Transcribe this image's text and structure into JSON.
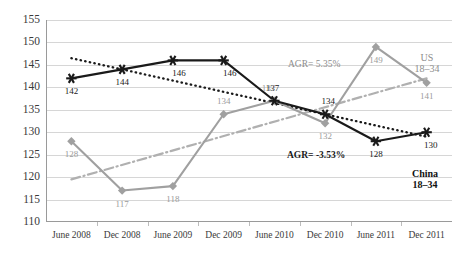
{
  "chart_data": {
    "type": "line",
    "title": "",
    "xlabel": "",
    "ylabel": "",
    "ylim": [
      110,
      155
    ],
    "ytick_step": 5,
    "yticks": [
      155,
      150,
      145,
      140,
      135,
      130,
      125,
      120,
      115,
      110
    ],
    "grid": true,
    "legend_position": "inline-right",
    "categories": [
      "June 2008",
      "Dec 2008",
      "June 2009",
      "Dec 2009",
      "June 2010",
      "Dec 2010",
      "June 2011",
      "Dec 2011"
    ],
    "series": [
      {
        "name": "China 18-34",
        "marker": "star",
        "color": "#1a1a1a",
        "values": [
          142,
          144,
          146,
          146,
          137,
          134,
          128,
          130
        ],
        "labels": [
          "142",
          "144",
          "146",
          "146",
          "137",
          "134",
          "128",
          "130"
        ]
      },
      {
        "name": "US 18-34",
        "marker": "diamond",
        "color": "#a0a0a0",
        "values": [
          128,
          117,
          118,
          134,
          137,
          132,
          149,
          141
        ],
        "labels": [
          "128",
          "117",
          "118",
          "134",
          "137",
          "132",
          "149",
          "141"
        ]
      }
    ],
    "trendlines": [
      {
        "name": "China trend",
        "style": "dotted",
        "color": "#1a1a1a",
        "start_value": 146.5,
        "end_value": 129.0,
        "annotation": "AGR= -3.53%"
      },
      {
        "name": "US trend",
        "style": "dash-dot",
        "color": "#b0b0b0",
        "start_value": 119.5,
        "end_value": 142.0,
        "annotation": "AGR= 5.35%"
      }
    ],
    "annotations": [
      {
        "text": "AGR= 5.35%",
        "series": "US 18-34"
      },
      {
        "text": "AGR= -3.53%",
        "series": "China 18-34"
      }
    ],
    "series_labels": [
      {
        "line1": "US",
        "line2": "18–34"
      },
      {
        "line1": "China",
        "line2": "18–34"
      }
    ]
  },
  "legend": {
    "us_line1": "US",
    "us_line2": "18–34",
    "china_line1": "China",
    "china_line2": "18–34"
  },
  "annotations": {
    "agr_us": "AGR= 5.35%",
    "agr_china": "AGR= -3.53%"
  }
}
